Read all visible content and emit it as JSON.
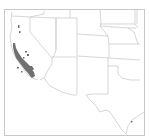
{
  "map": {
    "title": "Range map",
    "region": "Southwestern United States",
    "colors": {
      "background": "#ffffff",
      "frame": "#c8c8c8",
      "state_lines": "#c4c4c4",
      "range_fill": "#707070"
    },
    "states_shown": [
      "California",
      "Nevada",
      "Oregon",
      "Idaho",
      "Utah",
      "Arizona",
      "Wyoming",
      "Colorado",
      "New Mexico",
      "Nebraska",
      "Kansas",
      "Oklahoma",
      "Texas"
    ],
    "range_description": "Distribution concentrated in coastal and southern California"
  }
}
